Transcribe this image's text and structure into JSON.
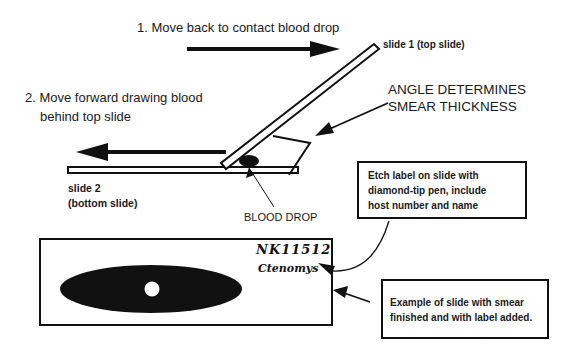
{
  "steps": {
    "step1": "1.  Move back to contact blood drop",
    "step2_line1": "2. Move forward drawing blood",
    "step2_line2": "behind top slide"
  },
  "slides": {
    "top_slide_label": "slide 1 (top slide)",
    "bottom_slide_label_line1": "slide 2",
    "bottom_slide_label_line2": "(bottom slide)",
    "blood_drop_label": "BLOOD DROP"
  },
  "angle_note": {
    "line1": "ANGLE DETERMINES",
    "line2": "SMEAR THICKNESS"
  },
  "callouts": {
    "etch": {
      "line1": "Etch label on slide with",
      "line2": "diamond-tip pen, include",
      "line3": "host number and name"
    },
    "example": {
      "line1": "Example of slide with smear",
      "line2": "finished and with label added."
    }
  },
  "example_slide": {
    "host_number": "NK11512",
    "host_name": "Ctenomys"
  },
  "colors": {
    "ink": "#111111",
    "background": "#ffffff"
  }
}
